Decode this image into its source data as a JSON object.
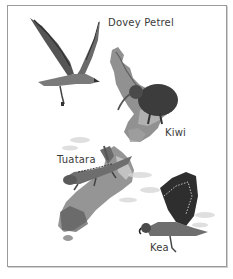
{
  "figure": {
    "labels": [
      {
        "id": "dovey-petrel",
        "text": "Dovey Petrel"
      },
      {
        "id": "kiwi",
        "text": "Kiwi"
      },
      {
        "id": "tuatara",
        "text": "Tuatara"
      },
      {
        "id": "kea",
        "text": "Kea"
      }
    ]
  },
  "colors": {
    "frame_border": "#9a9a9a",
    "land_dark": "#5e5e5e",
    "land_mid": "#8c8c8c",
    "land_light": "#c8c8c8",
    "bird_dark": "#3a3a3a",
    "label_text": "#3a3a3a"
  }
}
